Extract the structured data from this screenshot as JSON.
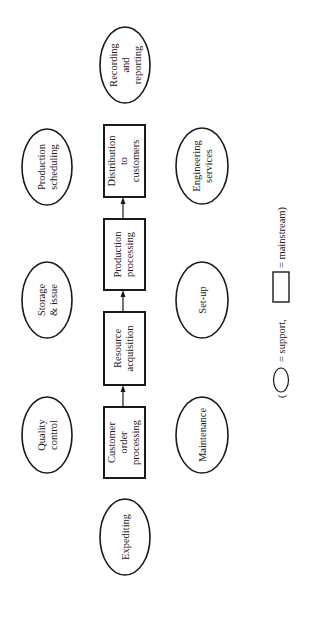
{
  "diagram": {
    "orientation": "rotated -90deg (text reads bottom-to-top)",
    "mainstream": [
      {
        "id": "customer-order-processing",
        "lines": [
          "Customer",
          "order",
          "processing"
        ],
        "box": {
          "x": 104,
          "y": 407,
          "w": 41,
          "h": 71
        }
      },
      {
        "id": "resource-acquisition",
        "lines": [
          "Resource",
          "acquisition"
        ],
        "box": {
          "x": 104,
          "y": 312,
          "w": 41,
          "h": 73
        }
      },
      {
        "id": "production-processing",
        "lines": [
          "Production",
          "processing"
        ],
        "box": {
          "x": 104,
          "y": 219,
          "w": 41,
          "h": 71
        }
      },
      {
        "id": "distribution-to-customers",
        "lines": [
          "Distribution",
          "to",
          "customers"
        ],
        "box": {
          "x": 104,
          "y": 125,
          "w": 41,
          "h": 72
        }
      }
    ],
    "support": [
      {
        "id": "expediting",
        "lines": [
          "Expediting"
        ],
        "cx": 125,
        "cy": 537,
        "rx": 25,
        "ry": 38
      },
      {
        "id": "quality-control",
        "lines": [
          "Quality",
          "control"
        ],
        "cx": 47,
        "cy": 435,
        "rx": 25,
        "ry": 38
      },
      {
        "id": "maintenance",
        "lines": [
          "Maintenance"
        ],
        "cx": 202,
        "cy": 435,
        "rx": 26,
        "ry": 38
      },
      {
        "id": "storage-issue",
        "lines": [
          "Storage",
          "& issue"
        ],
        "cx": 47,
        "cy": 300,
        "rx": 25,
        "ry": 38
      },
      {
        "id": "set-up",
        "lines": [
          "Set-up"
        ],
        "cx": 202,
        "cy": 300,
        "rx": 26,
        "ry": 38
      },
      {
        "id": "production-scheduling",
        "lines": [
          "Production",
          "scheduling"
        ],
        "cx": 47,
        "cy": 167,
        "rx": 25,
        "ry": 38
      },
      {
        "id": "engineering-services",
        "lines": [
          "Engineering",
          "services"
        ],
        "cx": 202,
        "cy": 166,
        "rx": 26,
        "ry": 38
      },
      {
        "id": "recording-reporting",
        "lines": [
          "Recording",
          "and",
          "reporting"
        ],
        "cx": 125,
        "cy": 65,
        "rx": 25,
        "ry": 38
      }
    ],
    "flow": [
      "customer-order-processing",
      "resource-acquisition",
      "production-processing",
      "distribution-to-customers"
    ],
    "legend": {
      "open_paren": "(",
      "support_label": "= support,",
      "mainstream_label": "= mainstream)"
    }
  }
}
